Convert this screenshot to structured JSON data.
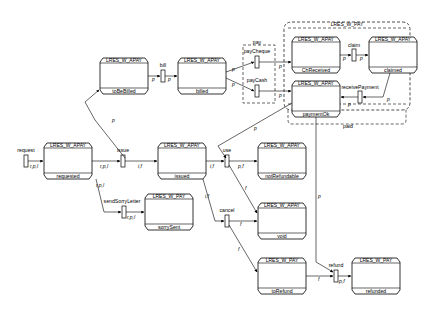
{
  "diagram": {
    "type": "petri-net-state-diagram",
    "colors": {
      "stroke": "#000000",
      "background": "#ffffff"
    },
    "groups": [
      {
        "id": "pay",
        "label": "pay",
        "style": "dashed"
      },
      {
        "id": "lres_w_pay",
        "label": "LRES_W_PAY",
        "style": "dashed"
      },
      {
        "id": "paid",
        "label": "paid"
      }
    ],
    "places": [
      {
        "id": "toBeBilled",
        "header": "LRES_W_APAY",
        "label": "toBeBilled"
      },
      {
        "id": "billed",
        "header": "LRES_W_APAY",
        "label": "billed"
      },
      {
        "id": "ChReceived",
        "header": "LRES_W_APAY",
        "label": "ChReceived"
      },
      {
        "id": "claimed",
        "header": "LRES_W_APAY",
        "label": "claimed"
      },
      {
        "id": "paymentOk",
        "header": "LRES_W_APAY",
        "label": "paymentOk"
      },
      {
        "id": "requested",
        "header": "LRES_W_APAY",
        "label": "requested"
      },
      {
        "id": "issued",
        "header": "LRES_W_APAY",
        "label": "issued"
      },
      {
        "id": "notRefundable",
        "header": "LRES_W_APAY",
        "label": "notRefundable"
      },
      {
        "id": "sorrySent",
        "header": "LRES_W_PAY",
        "label": "sorrySent"
      },
      {
        "id": "void",
        "header": "LRES_W_APAY",
        "label": "void"
      },
      {
        "id": "toRefund",
        "header": "LRES_W_PAY",
        "label": "toRefund"
      },
      {
        "id": "refunded",
        "header": "LRES_W_PAY",
        "label": "refunded"
      }
    ],
    "transitions": [
      {
        "id": "request",
        "label": "request"
      },
      {
        "id": "bill",
        "label": "bill"
      },
      {
        "id": "payCheque",
        "label": "payCheque"
      },
      {
        "id": "payCash",
        "label": "payCash"
      },
      {
        "id": "claim",
        "label": "claim"
      },
      {
        "id": "receivePayment",
        "label": "receivePayment"
      },
      {
        "id": "issue",
        "label": "issue"
      },
      {
        "id": "sendSorryLetter",
        "label": "sendSorryLetter"
      },
      {
        "id": "use",
        "label": "use"
      },
      {
        "id": "cancel",
        "label": "cancel"
      },
      {
        "id": "refund",
        "label": "refund"
      }
    ],
    "arc_labels": {
      "request_out": "r,p,l",
      "requested_issue": "r,p,l",
      "requested_sorry": "r,p,l",
      "sorry_out": "r,p,l",
      "issue_issued": "i,f",
      "issue_tobebilled": "p",
      "tobebilled_bill": "p",
      "bill_billed": "p",
      "billed_paycheque": "p",
      "billed_paycash": "p",
      "paycheque_chreceived": "p",
      "paycash_paymentok": "p",
      "chreceived_claim": "p",
      "claim_claimed": "p",
      "claimed_receive": "p",
      "receive_paymentok": "p",
      "paymentok_use": "p",
      "issued_use": "i,f",
      "use_notrefundable": "p,f",
      "use_void": "f",
      "issued_cancel": "i,f",
      "cancel_void": "f",
      "cancel_torefund": "f",
      "torefund_refund": "f",
      "paymentok_refund": "p",
      "refund_refunded": "p,f"
    }
  }
}
